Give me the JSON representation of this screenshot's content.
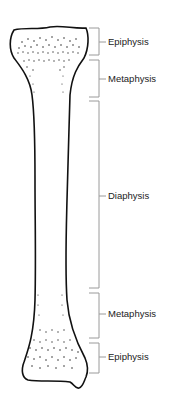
{
  "diagram": {
    "colors": {
      "outline": "#111111",
      "bracket": "#9a9a9a",
      "text": "#222222",
      "background": "#ffffff"
    },
    "labels": [
      {
        "id": "epiphysis-top",
        "text": "Epiphysis",
        "top": 28,
        "bottom": 55,
        "mid": 42
      },
      {
        "id": "metaphysis-top",
        "text": "Metaphysis",
        "top": 60,
        "bottom": 97,
        "mid": 79
      },
      {
        "id": "diaphysis",
        "text": "Diaphysis",
        "top": 101,
        "bottom": 288,
        "mid": 196
      },
      {
        "id": "metaphysis-bottom",
        "text": "Metaphysis",
        "top": 293,
        "bottom": 338,
        "mid": 314
      },
      {
        "id": "epiphysis-bottom",
        "text": "Epiphysis",
        "top": 343,
        "bottom": 373,
        "mid": 357
      }
    ]
  }
}
